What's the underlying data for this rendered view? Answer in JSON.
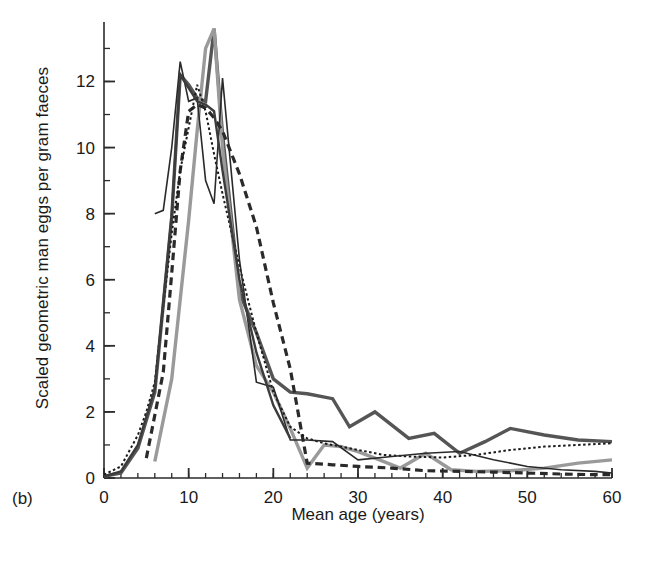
{
  "figure": {
    "panel_label": "(b)"
  },
  "chart_data": {
    "type": "line",
    "title": "",
    "subtitle": "",
    "xlabel": "Mean age (years)",
    "ylabel": "Scaled geometric man eggs per gram faeces",
    "xlim": [
      0,
      60
    ],
    "ylim": [
      0,
      13.8
    ],
    "xticks": [
      0,
      10,
      20,
      30,
      40,
      50,
      60
    ],
    "xtick_labels": [
      "0",
      "10",
      "20",
      "30",
      "40",
      "50",
      "60"
    ],
    "x_minor_tick_step": 2,
    "yticks": [
      0,
      2,
      4,
      6,
      8,
      10,
      12
    ],
    "ytick_labels": [
      "0",
      "2",
      "4",
      "6",
      "8",
      "10",
      "12"
    ],
    "y_minor_tick_step": 1,
    "grid": false,
    "legend": "none",
    "annotations": [
      "(b)"
    ],
    "series": [
      {
        "name": "thick-dark-gray-solid",
        "color": "#555555",
        "width": 3.4,
        "dash": "none",
        "x": [
          0,
          2,
          4,
          6,
          8,
          9,
          10,
          11,
          12,
          13,
          14,
          16,
          18,
          20,
          22,
          24,
          27,
          29,
          32,
          36,
          39,
          42,
          45,
          48,
          52,
          56,
          60
        ],
        "y": [
          0.05,
          0.15,
          0.9,
          2.6,
          7.9,
          12.2,
          11.9,
          11.5,
          11.4,
          13.6,
          10.4,
          5.6,
          4.4,
          3.0,
          2.6,
          2.55,
          2.4,
          1.55,
          2.0,
          1.2,
          1.35,
          0.75,
          1.1,
          1.5,
          1.3,
          1.15,
          1.1
        ]
      },
      {
        "name": "thick-light-gray-solid",
        "color": "#9a9a9a",
        "width": 3.4,
        "dash": "none",
        "x": [
          6,
          8,
          10,
          11,
          12,
          13,
          14,
          16,
          18,
          20,
          22,
          24,
          26,
          28,
          30,
          32,
          35,
          38,
          41,
          44,
          48,
          52,
          56,
          60
        ],
        "y": [
          0.5,
          3.0,
          7.8,
          10.5,
          13.0,
          13.6,
          10.0,
          5.4,
          3.4,
          2.6,
          1.5,
          0.3,
          1.0,
          0.95,
          0.8,
          0.6,
          0.3,
          0.75,
          0.25,
          0.2,
          0.22,
          0.3,
          0.45,
          0.55
        ]
      },
      {
        "name": "thick-black-dashed",
        "color": "#2a2a2a",
        "width": 3.2,
        "dash": "dashed",
        "x": [
          5,
          7,
          8,
          9,
          10,
          11,
          12,
          13,
          14,
          16,
          18,
          20,
          22,
          24,
          27,
          30,
          34,
          38,
          42,
          46,
          50,
          54,
          58,
          60
        ],
        "y": [
          0.6,
          3.2,
          6.2,
          9.3,
          11.1,
          11.3,
          11.2,
          10.9,
          10.5,
          9.2,
          7.6,
          5.3,
          3.3,
          0.45,
          0.4,
          0.35,
          0.3,
          0.22,
          0.2,
          0.18,
          0.15,
          0.12,
          0.1,
          0.1
        ]
      },
      {
        "name": "thin-black-dotted",
        "color": "#1a1a1a",
        "width": 2.0,
        "dash": "dotted",
        "x": [
          0,
          2,
          4,
          5,
          6,
          7,
          8,
          9,
          10,
          11,
          12,
          13,
          14,
          16,
          18,
          20,
          22,
          24,
          26,
          28,
          30,
          33,
          36,
          40,
          44,
          48,
          52,
          56,
          60
        ],
        "y": [
          0.1,
          0.35,
          1.3,
          2.0,
          2.9,
          5.2,
          7.4,
          9.3,
          10.6,
          11.9,
          11.1,
          9.8,
          8.6,
          6.4,
          4.4,
          2.6,
          1.55,
          1.2,
          1.05,
          0.95,
          0.85,
          0.7,
          0.65,
          0.62,
          0.7,
          0.85,
          0.95,
          1.0,
          1.05
        ]
      },
      {
        "name": "thin-black-solid-peak",
        "color": "#2a2a2a",
        "width": 1.6,
        "dash": "none",
        "x": [
          6,
          7,
          8,
          9,
          10,
          11,
          12,
          13,
          14,
          16,
          18,
          20,
          22,
          24,
          27,
          30,
          34,
          38,
          42,
          46,
          50,
          54,
          58,
          60
        ],
        "y": [
          8.0,
          8.1,
          10.0,
          12.6,
          11.4,
          11.5,
          9.0,
          8.3,
          12.1,
          6.6,
          2.9,
          2.75,
          1.15,
          1.15,
          1.1,
          0.55,
          0.65,
          0.75,
          0.8,
          0.55,
          0.35,
          0.25,
          0.2,
          0.15
        ]
      },
      {
        "name": "medium-dark-solid-steep",
        "color": "#3c3c3c",
        "width": 2.4,
        "dash": "none",
        "x": [
          0,
          2,
          4,
          6,
          8,
          9,
          10,
          11,
          12,
          13,
          14,
          16,
          18,
          20,
          22
        ],
        "y": [
          0.05,
          0.2,
          1.0,
          2.7,
          7.95,
          12.2,
          11.8,
          11.4,
          11.3,
          11.1,
          9.3,
          6.0,
          3.8,
          2.2,
          1.2
        ]
      }
    ]
  }
}
